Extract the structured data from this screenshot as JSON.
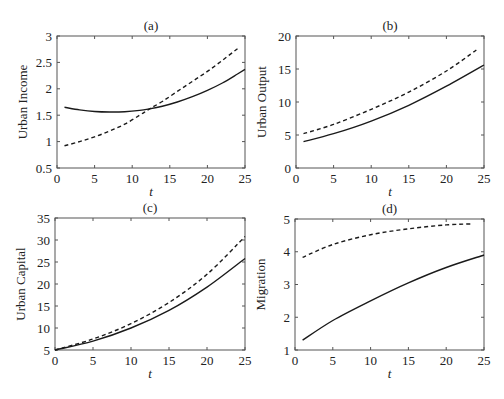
{
  "figure": {
    "background": "#ffffff",
    "line_color": "#1a1a1a",
    "axis_color": "#555555"
  },
  "chart_data": [
    {
      "id": "a",
      "type": "line",
      "title": "(a)",
      "xlabel": "t",
      "ylabel": "Urban Income",
      "xlim": [
        0,
        25
      ],
      "ylim": [
        0.5,
        3
      ],
      "xticks": [
        0,
        5,
        10,
        15,
        20,
        25
      ],
      "yticks": [
        0.5,
        1,
        1.5,
        2,
        2.5,
        3
      ],
      "ytick_labels": [
        "0.5",
        "1",
        "1.5",
        "2",
        "2.5",
        "3"
      ],
      "grid": false,
      "box": {
        "left": 57,
        "top": 36,
        "right": 245,
        "bottom": 168
      },
      "series": [
        {
          "name": "solid",
          "style": "solid",
          "x": [
            1,
            3,
            5,
            7,
            9,
            11,
            12.3,
            14,
            16,
            18,
            20,
            22,
            24,
            25
          ],
          "y": [
            1.65,
            1.6,
            1.57,
            1.56,
            1.565,
            1.59,
            1.62,
            1.67,
            1.75,
            1.85,
            1.97,
            2.11,
            2.28,
            2.37
          ]
        },
        {
          "name": "dashed",
          "style": "dashed",
          "x": [
            1,
            3,
            5,
            7,
            9,
            11,
            12.3,
            14,
            16,
            18,
            20,
            22,
            24
          ],
          "y": [
            0.92,
            1.0,
            1.09,
            1.2,
            1.33,
            1.5,
            1.62,
            1.76,
            1.95,
            2.14,
            2.33,
            2.54,
            2.76
          ]
        }
      ]
    },
    {
      "id": "b",
      "type": "line",
      "title": "(b)",
      "xlabel": "t",
      "ylabel": "Urban Output",
      "xlim": [
        0,
        25
      ],
      "ylim": [
        0,
        20
      ],
      "xticks": [
        0,
        5,
        10,
        15,
        20,
        25
      ],
      "yticks": [
        0,
        5,
        10,
        15,
        20
      ],
      "ytick_labels": [
        "0",
        "5",
        "10",
        "15",
        "20"
      ],
      "grid": false,
      "box": {
        "left": 296,
        "top": 36,
        "right": 484,
        "bottom": 168
      },
      "series": [
        {
          "name": "solid",
          "style": "solid",
          "x": [
            1,
            5,
            10,
            15,
            20,
            25
          ],
          "y": [
            4.0,
            5.2,
            7.1,
            9.5,
            12.4,
            15.6
          ]
        },
        {
          "name": "dashed",
          "style": "dashed",
          "x": [
            1,
            5,
            10,
            15,
            20,
            24
          ],
          "y": [
            5.2,
            6.6,
            8.9,
            11.5,
            14.7,
            17.9
          ]
        }
      ]
    },
    {
      "id": "c",
      "type": "line",
      "title": "(c)",
      "xlabel": "t",
      "ylabel": "Urban Capital",
      "xlim": [
        0,
        25
      ],
      "ylim": [
        5,
        35
      ],
      "xticks": [
        0,
        5,
        10,
        15,
        20,
        25
      ],
      "yticks": [
        5,
        10,
        15,
        20,
        25,
        30,
        35
      ],
      "ytick_labels": [
        "5",
        "10",
        "15",
        "20",
        "25",
        "30",
        "35"
      ],
      "grid": false,
      "box": {
        "left": 55,
        "top": 218,
        "right": 245,
        "bottom": 350
      },
      "series": [
        {
          "name": "solid",
          "style": "solid",
          "x": [
            0,
            5,
            10,
            15,
            20,
            25
          ],
          "y": [
            5.0,
            7.0,
            10.0,
            14.0,
            19.3,
            25.8
          ]
        },
        {
          "name": "dashed",
          "style": "dashed",
          "x": [
            0,
            5,
            10,
            15,
            20,
            25
          ],
          "y": [
            5.0,
            7.5,
            11.0,
            15.8,
            22.2,
            30.8
          ]
        }
      ]
    },
    {
      "id": "d",
      "type": "line",
      "title": "(d)",
      "xlabel": "t",
      "ylabel": "Migration",
      "xlim": [
        0,
        25
      ],
      "ylim": [
        1,
        5
      ],
      "xticks": [
        0,
        5,
        10,
        15,
        20,
        25
      ],
      "yticks": [
        1,
        2,
        3,
        4,
        5
      ],
      "ytick_labels": [
        "1",
        "2",
        "3",
        "4",
        "5"
      ],
      "grid": false,
      "box": {
        "left": 295,
        "top": 219,
        "right": 484,
        "bottom": 350
      },
      "series": [
        {
          "name": "solid",
          "style": "solid",
          "x": [
            1,
            5,
            10,
            15,
            20,
            25
          ],
          "y": [
            1.3,
            1.9,
            2.5,
            3.05,
            3.52,
            3.9
          ]
        },
        {
          "name": "dashed",
          "style": "dashed",
          "x": [
            1,
            5,
            10,
            15,
            20,
            23.5
          ],
          "y": [
            3.83,
            4.22,
            4.52,
            4.7,
            4.82,
            4.85
          ]
        }
      ]
    }
  ]
}
